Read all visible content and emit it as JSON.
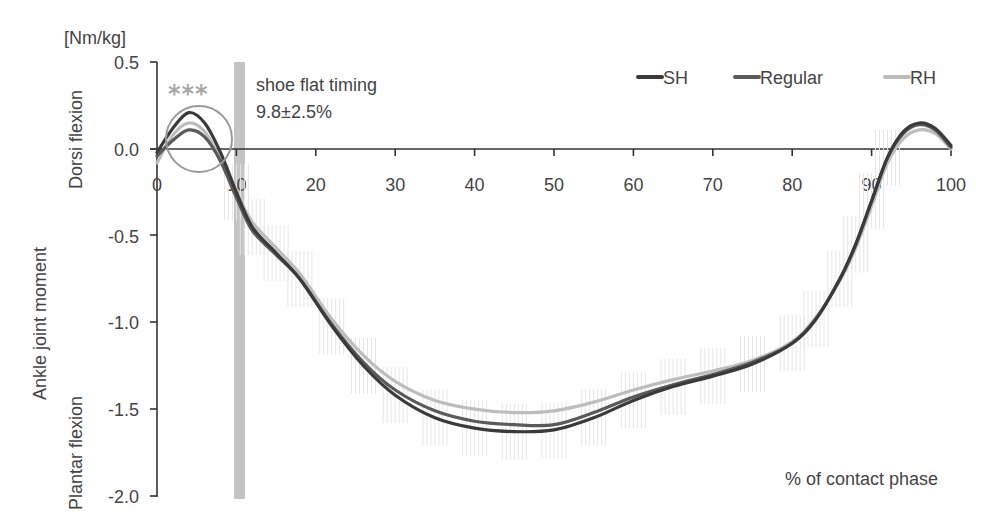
{
  "chart_data": {
    "type": "line",
    "title": "",
    "unit_label": "[Nm/kg]",
    "ylabel": "Ankle joint moment",
    "ylabel_upper": "Dorsi flexion",
    "ylabel_lower": "Plantar flexion",
    "xlabel": "% of contact phase",
    "xlim": [
      0,
      100
    ],
    "ylim": [
      -2.0,
      0.5
    ],
    "x_ticks": [
      "0",
      "10",
      "20",
      "30",
      "40",
      "50",
      "60",
      "70",
      "80",
      "90",
      "100"
    ],
    "y_ticks": [
      "0.5",
      "0.0",
      "-0.5",
      "-1.0",
      "-1.5",
      "-2.0"
    ],
    "grid": false,
    "legend_position": "top-right",
    "legend": [
      "SH",
      "Regular",
      "RH"
    ],
    "annotations": {
      "significance": "***",
      "shoe_flat_label": "shoe flat timing",
      "shoe_flat_value": "9.8±2.5%",
      "shoe_flat_x": 10.5
    },
    "x": [
      0,
      2,
      4,
      6,
      8,
      10,
      12,
      15,
      18,
      22,
      26,
      30,
      35,
      40,
      45,
      50,
      55,
      60,
      65,
      70,
      75,
      80,
      83,
      86,
      88,
      90,
      92,
      94,
      96,
      98,
      100
    ],
    "series": [
      {
        "name": "SH",
        "color": "#3a3a3a",
        "values": [
          -0.02,
          0.12,
          0.21,
          0.15,
          -0.02,
          -0.25,
          -0.45,
          -0.6,
          -0.75,
          -1.02,
          -1.25,
          -1.42,
          -1.55,
          -1.61,
          -1.63,
          -1.62,
          -1.55,
          -1.45,
          -1.37,
          -1.31,
          -1.24,
          -1.12,
          -0.98,
          -0.75,
          -0.55,
          -0.3,
          -0.05,
          0.1,
          0.15,
          0.12,
          0.02
        ]
      },
      {
        "name": "Regular",
        "color": "#5a5a5a",
        "values": [
          -0.04,
          0.05,
          0.11,
          0.07,
          -0.07,
          -0.28,
          -0.47,
          -0.61,
          -0.75,
          -1.01,
          -1.23,
          -1.39,
          -1.51,
          -1.57,
          -1.59,
          -1.59,
          -1.52,
          -1.43,
          -1.36,
          -1.3,
          -1.23,
          -1.12,
          -0.98,
          -0.75,
          -0.55,
          -0.3,
          -0.05,
          0.09,
          0.14,
          0.11,
          0.01
        ]
      },
      {
        "name": "RH",
        "color": "#bdbdbd",
        "values": [
          -0.08,
          0.08,
          0.15,
          0.1,
          -0.06,
          -0.25,
          -0.42,
          -0.57,
          -0.72,
          -0.98,
          -1.19,
          -1.34,
          -1.45,
          -1.5,
          -1.52,
          -1.51,
          -1.46,
          -1.39,
          -1.33,
          -1.28,
          -1.22,
          -1.11,
          -0.97,
          -0.76,
          -0.57,
          -0.33,
          -0.08,
          0.06,
          0.11,
          0.09,
          0.0
        ]
      }
    ]
  }
}
